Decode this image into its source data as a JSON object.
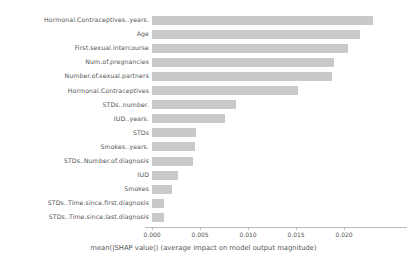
{
  "chart_data": {
    "type": "bar",
    "orientation": "horizontal",
    "title": "",
    "xlabel": "mean(|SHAP value|) (average impact on model output magnitude)",
    "ylabel": "",
    "xlim": [
      0.0,
      0.0235
    ],
    "xticks": [
      0.0,
      0.005,
      0.01,
      0.015,
      0.02
    ],
    "xticklabels": [
      "0.000",
      "0.005",
      "0.010",
      "0.015",
      "0.020"
    ],
    "grid": false,
    "legend": null,
    "bar_color": "#c9c9c9",
    "categories": [
      "Hormonal.Contraceptives..years.",
      "Age",
      "First.sexual.intercourse",
      "Num.of.pregnancies",
      "Number.of.sexual.partners",
      "Hormonal.Contraceptives",
      "STDs..number.",
      "IUD..years.",
      "STDs",
      "Smokes..years.",
      "STDs..Number.of.diagnosis",
      "IUD",
      "Smokes",
      "STDs..Time.since.first.diagnosis",
      "STDs..Time.since.last.diagnosis"
    ],
    "values": [
      0.023,
      0.0217,
      0.0204,
      0.019,
      0.0188,
      0.0152,
      0.0088,
      0.0076,
      0.0046,
      0.0045,
      0.0043,
      0.0027,
      0.0021,
      0.0013,
      0.0013
    ]
  }
}
